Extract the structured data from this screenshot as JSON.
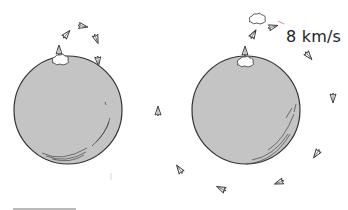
{
  "diagram": {
    "velocity_label": "8 km/s",
    "planet_fill": "#c4c4c4",
    "stroke": "#333333",
    "left_panel": {
      "description": "Rocket launched at insufficient speed arcs up and falls back to planet",
      "planet": {
        "cx": 68,
        "cy": 110,
        "r": 54
      }
    },
    "right_panel": {
      "description": "Rocket launched at 8 km/s enters orbit around planet",
      "planet": {
        "cx": 246,
        "cy": 110,
        "r": 54
      }
    }
  }
}
